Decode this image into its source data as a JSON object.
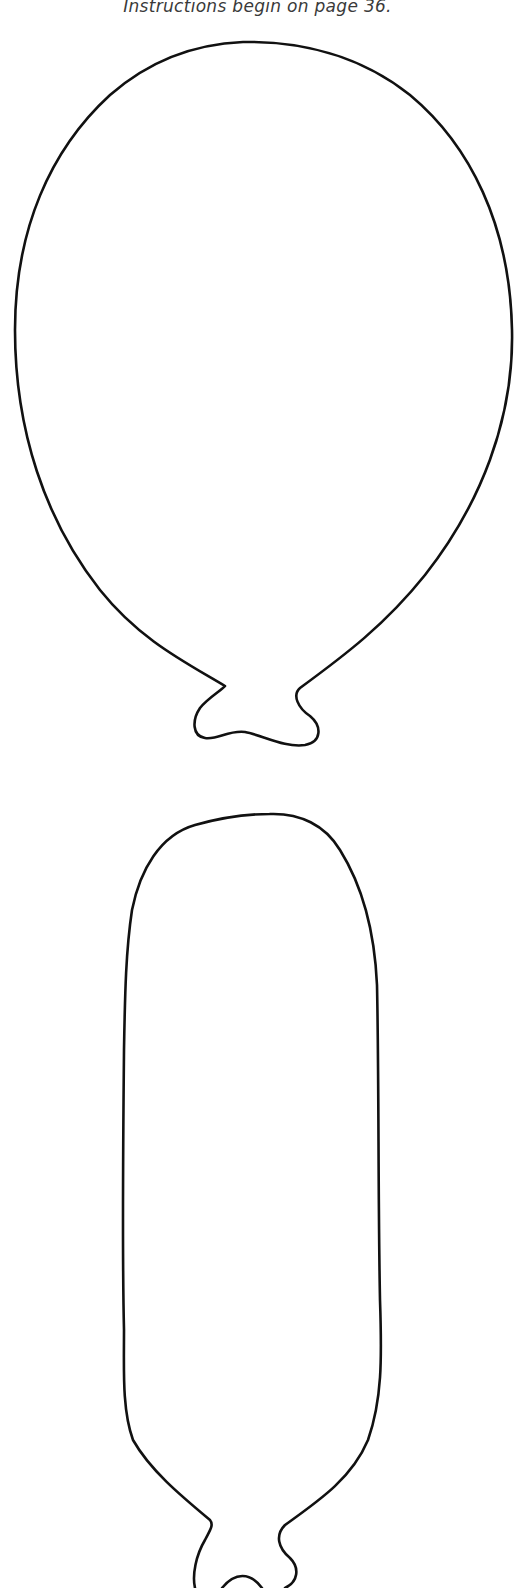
{
  "page": {
    "caption": "Instructions begin on page 36.",
    "background": "#ffffff",
    "line_color": "#111111"
  },
  "shapes": [
    {
      "name": "round-balloon-template",
      "label": "Round balloon outline with knot"
    },
    {
      "name": "long-balloon-template",
      "label": "Elongated balloon outline with knot"
    }
  ]
}
